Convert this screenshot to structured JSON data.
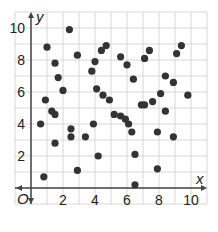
{
  "chart_data": {
    "type": "scatter",
    "title": "",
    "xlabel": "x",
    "ylabel": "y",
    "origin_label": "O",
    "xlim": [
      -1,
      11
    ],
    "ylim": [
      -1,
      11
    ],
    "grid": true,
    "x_ticks": [
      2,
      4,
      6,
      8,
      10
    ],
    "y_ticks": [
      2,
      4,
      6,
      8,
      10
    ],
    "point_color": "#333333",
    "grid_color": "#d6d6d6",
    "points": [
      [
        1.0,
        8.8
      ],
      [
        1.5,
        7.8
      ],
      [
        1.7,
        6.9
      ],
      [
        2.0,
        6.1
      ],
      [
        2.4,
        9.9
      ],
      [
        2.9,
        8.3
      ],
      [
        0.9,
        5.5
      ],
      [
        1.3,
        4.8
      ],
      [
        1.5,
        4.6
      ],
      [
        0.6,
        4.0
      ],
      [
        1.5,
        2.8
      ],
      [
        2.5,
        3.7
      ],
      [
        2.5,
        3.2
      ],
      [
        3.4,
        3.2
      ],
      [
        3.9,
        4.0
      ],
      [
        4.2,
        2.0
      ],
      [
        2.9,
        1.1
      ],
      [
        0.8,
        0.7
      ],
      [
        4.7,
        8.9
      ],
      [
        4.4,
        8.6
      ],
      [
        4.0,
        7.9
      ],
      [
        3.8,
        7.3
      ],
      [
        4.1,
        6.2
      ],
      [
        4.5,
        5.8
      ],
      [
        4.9,
        5.5
      ],
      [
        5.6,
        8.2
      ],
      [
        6.0,
        7.7
      ],
      [
        6.4,
        6.8
      ],
      [
        5.2,
        4.6
      ],
      [
        5.6,
        4.5
      ],
      [
        5.9,
        4.3
      ],
      [
        6.1,
        4.0
      ],
      [
        6.3,
        3.5
      ],
      [
        6.5,
        2.1
      ],
      [
        6.5,
        0.2
      ],
      [
        7.1,
        8.1
      ],
      [
        7.4,
        8.6
      ],
      [
        9.1,
        8.4
      ],
      [
        9.4,
        8.9
      ],
      [
        8.4,
        7.0
      ],
      [
        8.9,
        6.6
      ],
      [
        9.8,
        5.8
      ],
      [
        8.1,
        5.9
      ],
      [
        7.6,
        5.4
      ],
      [
        6.9,
        5.2
      ],
      [
        7.1,
        5.2
      ],
      [
        8.4,
        4.8
      ],
      [
        7.9,
        3.5
      ],
      [
        8.9,
        3.2
      ],
      [
        7.9,
        1.2
      ]
    ]
  }
}
